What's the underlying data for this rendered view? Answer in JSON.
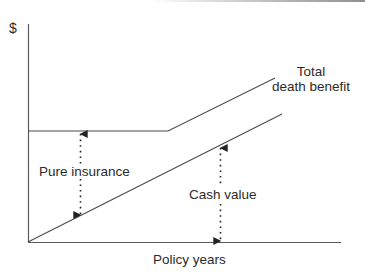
{
  "diagram": {
    "type": "line-diagram",
    "y_axis_label": "$",
    "x_axis_label": "Policy years",
    "lines": {
      "total_death_benefit": {
        "label_line1": "Total",
        "label_line2": "death benefit"
      },
      "cash_value_line": {}
    },
    "annotations": {
      "pure_insurance": "Pure insurance",
      "cash_value": "Cash value"
    },
    "colors": {
      "line": "#4a4a4a",
      "axis": "#5a5a5a",
      "text": "#2b2b2b"
    }
  }
}
